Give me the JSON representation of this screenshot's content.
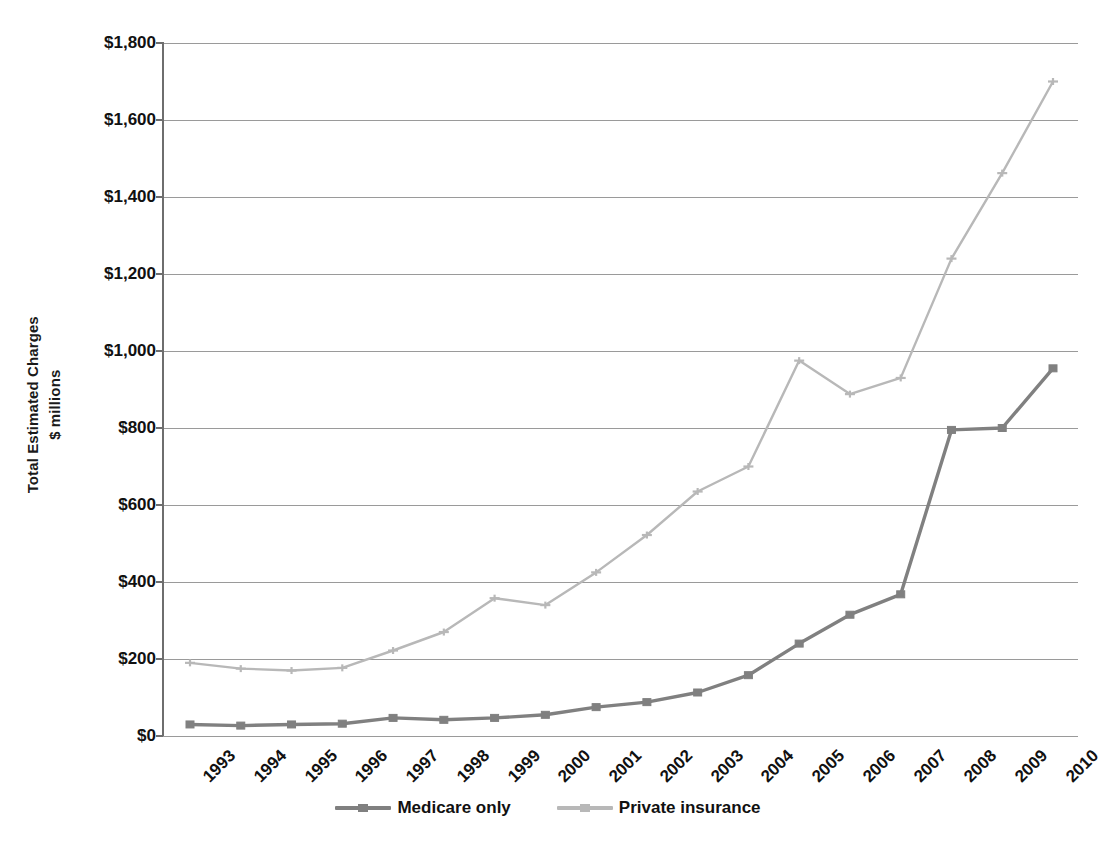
{
  "chart_data": {
    "type": "line",
    "title": "",
    "xlabel": "",
    "ylabel": "Total Estimated Charges $ millions",
    "ylabel_lines": [
      "Total Estimated Charges",
      "$ millions"
    ],
    "categories": [
      "1993",
      "1994",
      "1995",
      "1996",
      "1997",
      "1998",
      "1999",
      "2000",
      "2001",
      "2002",
      "2003",
      "2004",
      "2005",
      "2006",
      "2007",
      "2008",
      "2009",
      "2010"
    ],
    "ylim": [
      0,
      1800
    ],
    "ytick_values": [
      0,
      200,
      400,
      600,
      800,
      1000,
      1200,
      1400,
      1600,
      1800
    ],
    "ytick_labels": [
      "$0",
      "$200",
      "$400",
      "$600",
      "$800",
      "$1,000",
      "$1,200",
      "$1,400",
      "$1,600",
      "$1,800"
    ],
    "grid": true,
    "legend_position": "bottom",
    "series": [
      {
        "name": "Medicare only",
        "color": "#808080",
        "marker": "square",
        "values": [
          30,
          27,
          30,
          32,
          47,
          42,
          47,
          55,
          75,
          88,
          113,
          158,
          240,
          315,
          368,
          795,
          800,
          955
        ]
      },
      {
        "name": "Private insurance",
        "color": "#b8b8b8",
        "marker": "cross",
        "values": [
          190,
          175,
          170,
          177,
          222,
          270,
          358,
          340,
          425,
          522,
          635,
          700,
          975,
          888,
          930,
          1240,
          1462,
          1700
        ]
      }
    ]
  },
  "legend": {
    "items": [
      {
        "label": "Medicare only",
        "color": "#808080"
      },
      {
        "label": "Private insurance",
        "color": "#b8b8b8"
      }
    ]
  },
  "axes": {
    "y_title_line1": "Total Estimated Charges",
    "y_title_line2": "$ millions"
  },
  "colors": {
    "medicare": "#808080",
    "private": "#b8b8b8",
    "grid": "#9a9a9a",
    "axis": "#6e6e6e",
    "text": "#111111"
  }
}
